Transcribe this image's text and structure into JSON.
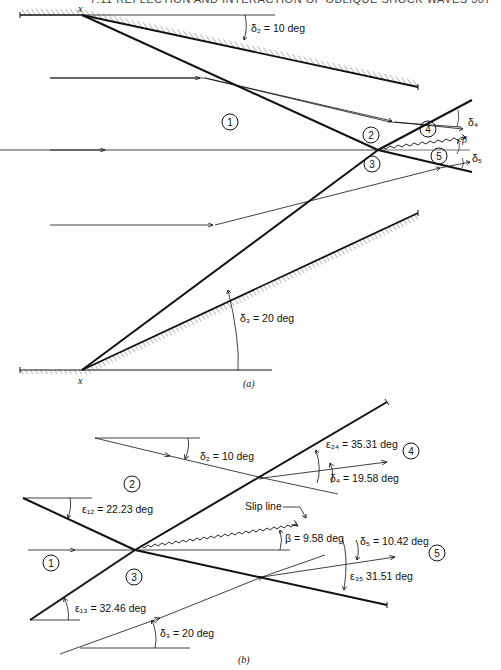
{
  "header": {
    "running_title": "7.11 REFLECTION AND INTERACTION OF OBLIQUE SHOCK WAVES 307"
  },
  "figure_a": {
    "caption": "(a)",
    "corner_marker": "x",
    "labels": {
      "delta2": "δ₂ = 10 deg",
      "delta3": "δ₃ = 20 deg",
      "delta4": "δ₄",
      "delta5": "δ₅",
      "beta": "β"
    },
    "regions": [
      "1",
      "2",
      "3",
      "4",
      "5"
    ]
  },
  "figure_b": {
    "caption": "(b)",
    "slip_line_label": "Slip line",
    "labels": {
      "delta2": "δ₂ = 10 deg",
      "eps12": "ε₁₂ = 22.23 deg",
      "eps24": "ε₂₄ = 35.31 deg",
      "delta4": "δ₄ = 19.58 deg",
      "beta": "β = 9.58 deg",
      "delta5": "δ₅ = 10.42 deg",
      "eps35": "ε₃₅ 31.51 deg",
      "eps13": "ε₁₃ = 32.46 deg",
      "delta3": "δ₃ = 20 deg"
    },
    "regions": [
      "1",
      "2",
      "3",
      "4",
      "5"
    ]
  }
}
